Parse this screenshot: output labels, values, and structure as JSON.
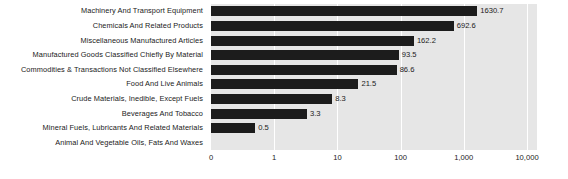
{
  "chart_data": {
    "type": "bar",
    "orientation": "horizontal",
    "title": "",
    "subtitle": "",
    "xlabel": "",
    "ylabel": "",
    "scale": "log",
    "grid": true,
    "legend": null,
    "categories": [
      "Machinery And Transport Equipment",
      "Chemicals And Related Products",
      "Miscellaneous Manufactured Articles",
      "Manufactured Goods Classified Chiefly By Material",
      "Commodities & Transactions Not Classified Elsewhere",
      "Food And Live Animals",
      "Crude Materials, Inedible, Except Fuels",
      "Beverages And Tobacco",
      "Mineral Fuels, Lubricants And Related Materials",
      "Animal And Vegetable Oils, Fats And Waxes"
    ],
    "values": [
      1630.7,
      692.6,
      162.2,
      93.5,
      86.6,
      21.5,
      8.3,
      3.3,
      0.5,
      null
    ],
    "value_labels": [
      "1630.7",
      "692.6",
      "162.2",
      "93.5",
      "86.6",
      "21.5",
      "8.3",
      "3.3",
      "0.5",
      ""
    ],
    "xticks": [
      {
        "label": "0",
        "pos": 0
      },
      {
        "label": "1",
        "pos": 1
      },
      {
        "label": "10",
        "pos": 2
      },
      {
        "label": "100",
        "pos": 3
      },
      {
        "label": "1,000",
        "pos": 4
      },
      {
        "label": "10,000",
        "pos": 5
      }
    ],
    "xlim": [
      0,
      10000
    ],
    "colors": {
      "bar": "#1c1c1c",
      "plot_background": "#e6e6e6",
      "gridline": "#ffffff",
      "text": "#1a1a1a",
      "page_background": "#ffffff"
    }
  }
}
